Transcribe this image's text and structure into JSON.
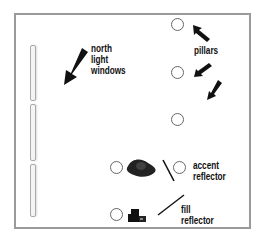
{
  "diagram": {
    "type": "studio lighting floor plan",
    "labels": {
      "north_light": [
        "north",
        "light",
        "windows"
      ],
      "pillars": "pillars",
      "accent_reflector": [
        "accent",
        "reflector"
      ],
      "fill_reflector": [
        "fill",
        "reflector"
      ]
    },
    "elements": {
      "windows_count": 3,
      "pillars_count": 4,
      "subject_positions": 2
    },
    "colors": {
      "frame": "#9a9a9a",
      "arrow": "#111111",
      "circle_stroke": "#666666",
      "window_stroke": "#aaaaaa"
    },
    "icons": [
      "arrow-icon",
      "pillar-icon",
      "subject-icon",
      "camera-icon",
      "reflector-icon"
    ]
  }
}
